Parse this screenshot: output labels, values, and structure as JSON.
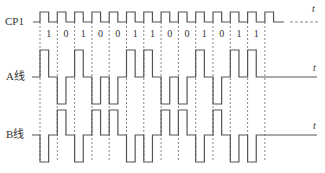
{
  "signals": {
    "clock": {
      "label": "CP1",
      "axis_label": "t"
    },
    "a_line": {
      "label": "A线",
      "axis_label": "t"
    },
    "b_line": {
      "label": "B线",
      "axis_label": "t"
    }
  },
  "bits": [
    "1",
    "0",
    "1",
    "0",
    "0",
    "1",
    "1",
    "0",
    "0",
    "1",
    "0",
    "1",
    "1"
  ],
  "encoding": {
    "bit_1": "A high / B low for first half of bit cell, then both return to middle level",
    "bit_0": "A low / B high for first half of bit cell, then both return to middle level"
  },
  "layout": {
    "x_start": 40,
    "cell_width": 17.3,
    "clock": {
      "base": 22,
      "high": 12,
      "line_start": 33,
      "end": 284,
      "dash_start": 290,
      "dash_end": 318
    },
    "a": {
      "mid": 77,
      "high": 50,
      "low": 104,
      "line_start": 32,
      "end": 317
    },
    "b": {
      "mid": 135,
      "high": 110,
      "low": 162,
      "line_start": 32,
      "end": 317
    },
    "grid_top": 22,
    "grid_bottom": 162,
    "colors": {
      "stroke": "#555555",
      "text": "#333333"
    }
  }
}
